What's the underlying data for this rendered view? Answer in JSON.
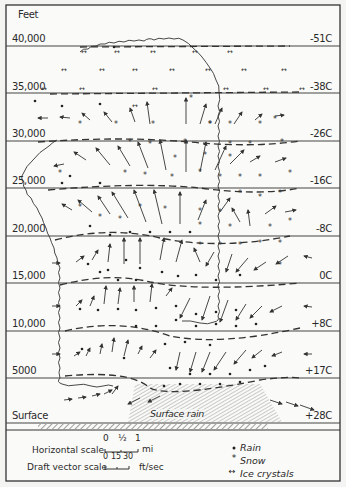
{
  "figure": {
    "y_unit_label": "Feet",
    "altitudes": [
      {
        "label": "40,000",
        "y": 46
      },
      {
        "label": "35,000",
        "y": 93
      },
      {
        "label": "30,000",
        "y": 141
      },
      {
        "label": "25,000",
        "y": 188
      },
      {
        "label": "20,000",
        "y": 236
      },
      {
        "label": "15,000",
        "y": 283
      },
      {
        "label": "10,000",
        "y": 331
      },
      {
        "label": "5000",
        "y": 378
      },
      {
        "label": "Surface",
        "y": 423
      }
    ],
    "temperatures": [
      {
        "label": "-51C",
        "y": 46
      },
      {
        "label": "-38C",
        "y": 93
      },
      {
        "label": "-26C",
        "y": 141
      },
      {
        "label": "-16C",
        "y": 188
      },
      {
        "label": "-8C",
        "y": 236
      },
      {
        "label": "0C",
        "y": 283
      },
      {
        "label": "+8C",
        "y": 331
      },
      {
        "label": "+17C",
        "y": 378
      },
      {
        "label": "+28C",
        "y": 423
      }
    ],
    "surface_rain_label": "Surface rain",
    "horizontal_scale": {
      "label": "Horizontal scale",
      "ticks": [
        "0",
        "½",
        "1"
      ],
      "unit": "mi"
    },
    "draft_vector_scale": {
      "label": "Draft vector scale",
      "ticks": [
        "0",
        "15",
        "30"
      ],
      "unit": "ft/sec"
    },
    "legend": [
      {
        "symbol": "dot",
        "label": "Rain"
      },
      {
        "symbol": "asterisk",
        "label": "Snow"
      },
      {
        "symbol": "double-arrow",
        "label": "Ice crystals"
      }
    ]
  }
}
